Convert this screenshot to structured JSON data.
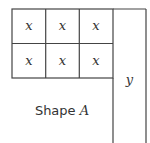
{
  "diagram": {
    "grid": {
      "rows": 2,
      "cols": 3,
      "cells": [
        [
          "x",
          "x",
          "x"
        ],
        [
          "x",
          "x",
          "x"
        ]
      ]
    },
    "side_bar_label": "y",
    "shape_label_prefix": "Shape ",
    "shape_label_letter": "A",
    "colors": {
      "line": "#444444",
      "text": "#333333",
      "background": "#ffffff"
    }
  }
}
